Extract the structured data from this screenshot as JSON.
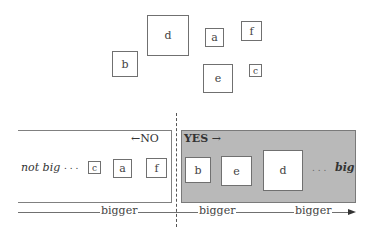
{
  "top_cluster": {
    "boxes": [
      {
        "label": "d",
        "x": 147,
        "y": 15,
        "w": 42,
        "h": 41
      },
      {
        "label": "b",
        "x": 112,
        "y": 51,
        "w": 26,
        "h": 26
      },
      {
        "label": "a",
        "x": 205,
        "y": 28,
        "w": 19,
        "h": 19
      },
      {
        "label": "f",
        "x": 241,
        "y": 21,
        "w": 21,
        "h": 20
      },
      {
        "label": "e",
        "x": 203,
        "y": 64,
        "w": 30,
        "h": 29
      },
      {
        "label": "c",
        "x": 249,
        "y": 64,
        "w": 13,
        "h": 13
      }
    ]
  },
  "no_region": {
    "label": "NO",
    "arrow": "←",
    "end_label": "not big",
    "ellipsis": ". . .",
    "boxes": [
      {
        "label": "c",
        "x": 88,
        "y": 161,
        "w": 13,
        "h": 13
      },
      {
        "label": "a",
        "x": 113,
        "y": 159,
        "w": 19,
        "h": 19
      },
      {
        "label": "f",
        "x": 146,
        "y": 158,
        "w": 21,
        "h": 20
      }
    ]
  },
  "yes_region": {
    "label": "YES",
    "arrow": "→",
    "end_label": "big",
    "ellipsis": ". . .",
    "fill_color": "#b9b9b9",
    "boxes": [
      {
        "label": "b",
        "x": 185,
        "y": 157,
        "w": 26,
        "h": 26
      },
      {
        "label": "e",
        "x": 221,
        "y": 156,
        "w": 31,
        "h": 30
      },
      {
        "label": "d",
        "x": 263,
        "y": 150,
        "w": 40,
        "h": 41
      }
    ]
  },
  "axis": {
    "labels": [
      "bigger",
      "bigger",
      "bigger"
    ]
  }
}
